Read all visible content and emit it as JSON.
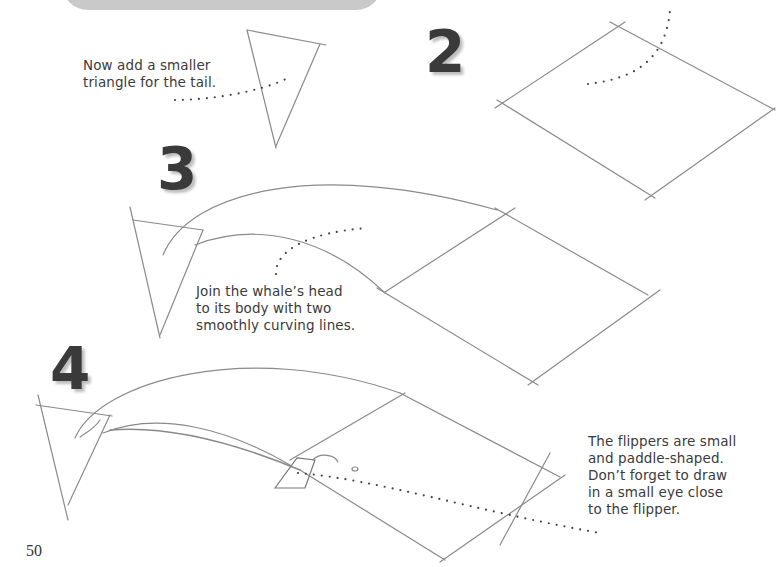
{
  "page": {
    "page_number": "50",
    "banner_color": "#c9c9c9"
  },
  "steps": [
    {
      "number": "2",
      "caption": []
    },
    {
      "number": "3",
      "caption": [
        "Join the whale’s head",
        "to its body with two",
        "smoothly curving lines."
      ]
    },
    {
      "number": "4",
      "caption": [
        "The flippers are small",
        "and paddle-shaped.",
        "Don’t forget to draw",
        "in a small eye close",
        "to the flipper."
      ]
    }
  ],
  "tail_note": {
    "caption": [
      "Now add a smaller",
      "triangle for the tail."
    ]
  },
  "colors": {
    "pencil": "#8a8a8a",
    "number_fill": "#3a3a3a",
    "dots": "#444444"
  }
}
